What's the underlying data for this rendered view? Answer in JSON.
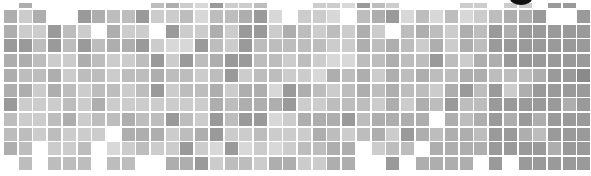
{
  "chart_data": {
    "type": "heatmap",
    "title": "",
    "xlabel": "",
    "ylabel": "",
    "colorscale": "grayscale (0 = white/empty, 1 = lightest gray ... 9 = darkest gray)",
    "grid": {
      "columns": 40,
      "rows": 12,
      "x0": -11,
      "y0": -5,
      "pitch_x": 14.7,
      "pitch_y": 14.7,
      "cell_size": 13,
      "top_row_height": 5
    },
    "matrix": [
      [
        0,
        5,
        0,
        0,
        0,
        0,
        0,
        0,
        0,
        0,
        4,
        5,
        3,
        2,
        6,
        3,
        3,
        4,
        0,
        0,
        0,
        3,
        3,
        2,
        6,
        4,
        3,
        0,
        0,
        0,
        0,
        3,
        3,
        0,
        3,
        3,
        0,
        6,
        6,
        0
      ],
      [
        5,
        3,
        5,
        0,
        0,
        6,
        5,
        4,
        4,
        6,
        3,
        3,
        4,
        2,
        4,
        4,
        5,
        6,
        2,
        0,
        3,
        3,
        2,
        0,
        4,
        5,
        6,
        2,
        4,
        2,
        4,
        2,
        3,
        4,
        5,
        5,
        6,
        0,
        0,
        6
      ],
      [
        5,
        3,
        3,
        6,
        4,
        3,
        0,
        5,
        3,
        3,
        0,
        6,
        3,
        3,
        5,
        3,
        6,
        6,
        3,
        5,
        4,
        3,
        4,
        3,
        5,
        3,
        0,
        4,
        5,
        4,
        3,
        5,
        4,
        6,
        5,
        6,
        6,
        6,
        6,
        6
      ],
      [
        6,
        6,
        4,
        6,
        4,
        6,
        4,
        5,
        5,
        6,
        3,
        2,
        2,
        6,
        4,
        3,
        6,
        4,
        4,
        4,
        4,
        4,
        3,
        3,
        5,
        4,
        5,
        4,
        3,
        5,
        3,
        5,
        4,
        6,
        6,
        6,
        6,
        6,
        6,
        6
      ],
      [
        5,
        5,
        4,
        3,
        3,
        5,
        4,
        3,
        3,
        4,
        6,
        3,
        6,
        4,
        5,
        6,
        6,
        4,
        4,
        3,
        4,
        3,
        2,
        2,
        4,
        4,
        5,
        4,
        4,
        6,
        4,
        3,
        5,
        5,
        6,
        6,
        6,
        6,
        6,
        6
      ],
      [
        5,
        4,
        4,
        5,
        3,
        4,
        4,
        3,
        4,
        4,
        5,
        4,
        4,
        3,
        4,
        6,
        3,
        4,
        4,
        3,
        3,
        2,
        5,
        4,
        5,
        3,
        5,
        4,
        5,
        4,
        4,
        5,
        5,
        4,
        4,
        4,
        5,
        6,
        6,
        7
      ],
      [
        5,
        5,
        3,
        5,
        4,
        3,
        4,
        4,
        3,
        4,
        6,
        3,
        4,
        4,
        5,
        3,
        5,
        5,
        2,
        6,
        5,
        4,
        3,
        4,
        5,
        4,
        5,
        4,
        4,
        3,
        5,
        6,
        4,
        6,
        3,
        5,
        6,
        6,
        6,
        6
      ],
      [
        6,
        3,
        3,
        3,
        4,
        3,
        5,
        3,
        3,
        3,
        3,
        3,
        3,
        3,
        5,
        4,
        5,
        5,
        5,
        6,
        3,
        3,
        4,
        4,
        4,
        3,
        5,
        3,
        5,
        4,
        6,
        4,
        4,
        6,
        6,
        6,
        6,
        6,
        5,
        6
      ],
      [
        4,
        3,
        3,
        4,
        5,
        3,
        4,
        4,
        5,
        4,
        4,
        6,
        4,
        3,
        6,
        4,
        6,
        6,
        2,
        3,
        5,
        5,
        5,
        6,
        4,
        5,
        5,
        5,
        5,
        0,
        5,
        4,
        5,
        6,
        5,
        6,
        5,
        6,
        6,
        6
      ],
      [
        4,
        4,
        3,
        4,
        3,
        3,
        3,
        0,
        5,
        5,
        5,
        3,
        4,
        5,
        6,
        3,
        3,
        4,
        3,
        3,
        3,
        5,
        4,
        3,
        4,
        5,
        3,
        6,
        5,
        4,
        5,
        5,
        4,
        6,
        6,
        5,
        4,
        6,
        6,
        6
      ],
      [
        5,
        4,
        0,
        3,
        3,
        4,
        0,
        2,
        3,
        4,
        3,
        3,
        6,
        3,
        2,
        6,
        2,
        3,
        2,
        3,
        4,
        4,
        5,
        5,
        0,
        3,
        4,
        4,
        0,
        5,
        5,
        5,
        5,
        6,
        6,
        6,
        6,
        5,
        6,
        6
      ],
      [
        0,
        4,
        0,
        4,
        4,
        4,
        0,
        4,
        4,
        0,
        0,
        5,
        5,
        6,
        3,
        4,
        4,
        3,
        5,
        5,
        3,
        3,
        5,
        5,
        0,
        0,
        6,
        0,
        5,
        5,
        5,
        5,
        0,
        6,
        0,
        6,
        6,
        6,
        6,
        6
      ]
    ]
  },
  "decor": {
    "blob_color": "#111111"
  }
}
